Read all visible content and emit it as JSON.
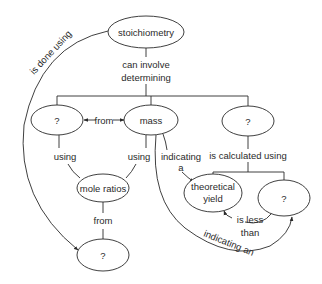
{
  "diagram": {
    "type": "concept-map",
    "colors": {
      "line": "#2a2a2a",
      "background": "#ffffff"
    },
    "nodes": {
      "stoichiometry": "stoichiometry",
      "left_unknown": "?",
      "mass": "mass",
      "right_unknown": "?",
      "mole_ratios": "mole ratios",
      "theoretical_yield_line1": "theoretical",
      "theoretical_yield_line2": "yield",
      "yield_unknown": "?",
      "bottom_unknown": "?"
    },
    "links": {
      "is_done_using": "is done using",
      "can_involve_line1": "can involve",
      "can_involve_line2": "determining",
      "from_mass": "from",
      "using_left": "using",
      "using_right": "using",
      "indicating_a_line1": "indicating",
      "indicating_a_line2": "a",
      "is_calculated_using": "is calculated using",
      "from_mole_ratios": "from",
      "is_less_line1": "is less",
      "is_less_line2": "than",
      "indicating_an": "indicating an"
    }
  }
}
